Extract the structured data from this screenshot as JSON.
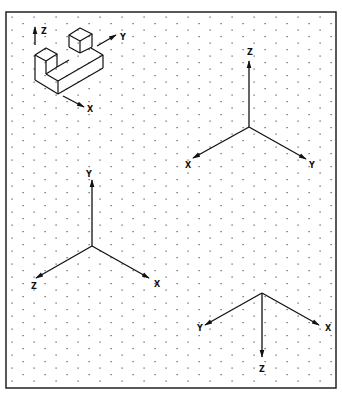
{
  "figure": {
    "frame": {
      "x": 6,
      "y": 12,
      "width": 330,
      "height": 376,
      "stroke": "#222222"
    },
    "grid": {
      "type": "isometric-dots",
      "dx": 11,
      "dy": 13,
      "color": "#555555"
    },
    "colors": {
      "line": "#111111",
      "text": "#111111"
    }
  },
  "block_example": {
    "axes": {
      "z": {
        "label": "Z"
      },
      "y": {
        "label": "Y"
      },
      "x": {
        "label": "X"
      }
    }
  },
  "axis_systems": [
    {
      "name": "top-right",
      "labels": {
        "up": "Z",
        "left": "X",
        "right": "Y"
      }
    },
    {
      "name": "middle-left",
      "labels": {
        "up": "Y",
        "left": "Z",
        "right": "X"
      }
    },
    {
      "name": "bottom-right",
      "labels": {
        "down": "Z",
        "left": "Y",
        "right": "X"
      }
    }
  ]
}
